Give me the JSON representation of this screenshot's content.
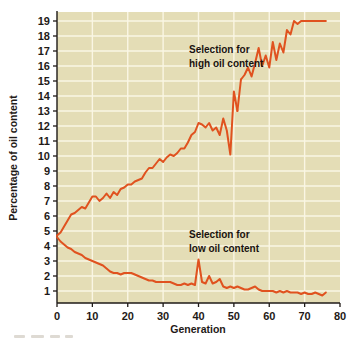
{
  "figure": {
    "background_color": "#ffffff",
    "plot_background_color": "#e4ddb6",
    "grid_color": "#faf6e4",
    "line_color": "#e0521f",
    "axis_color": "#1f1a17"
  },
  "axes": {
    "x": {
      "label": "Generation",
      "ticks": [
        0,
        10,
        20,
        30,
        40,
        50,
        60,
        70,
        80
      ],
      "tick_labels": [
        "0",
        "10",
        "20",
        "30",
        "40",
        "50",
        "60",
        "70",
        "80"
      ],
      "range": [
        0,
        80
      ]
    },
    "y": {
      "label": "Percentage of oil content",
      "ticks": [
        1,
        2,
        3,
        4,
        5,
        6,
        7,
        8,
        9,
        10,
        11,
        12,
        13,
        14,
        15,
        16,
        17,
        18,
        19
      ],
      "tick_labels": [
        "1",
        "2",
        "3",
        "4",
        "5",
        "6",
        "7",
        "8",
        "9",
        "10",
        "11",
        "12",
        "13",
        "14",
        "15",
        "16",
        "17",
        "18",
        "19"
      ],
      "range": [
        0.2,
        19.6
      ]
    }
  },
  "annotations": [
    {
      "id": "high-label",
      "line1": "Selection for",
      "line2": "high oil content",
      "x": 46,
      "y": 17.2
    },
    {
      "id": "low-label",
      "line1": "Selection for",
      "line2": "low oil content",
      "x": 46,
      "y": 4.3
    }
  ],
  "chart_data": {
    "type": "line",
    "title": "",
    "xlabel": "Generation",
    "ylabel": "Percentage of oil content",
    "xlim": [
      0,
      80
    ],
    "ylim": [
      0.2,
      19.6
    ],
    "grid": true,
    "legend": "none",
    "annotations_text": [
      "Selection for high oil content",
      "Selection for low oil content"
    ],
    "series": [
      {
        "name": "Selection for high oil content",
        "color": "#e0521f",
        "x": [
          0,
          1,
          2,
          3,
          4,
          5,
          6,
          7,
          8,
          9,
          10,
          11,
          12,
          13,
          14,
          15,
          16,
          17,
          18,
          19,
          20,
          21,
          22,
          23,
          24,
          25,
          26,
          27,
          28,
          29,
          30,
          31,
          32,
          33,
          34,
          35,
          36,
          37,
          38,
          39,
          40,
          41,
          42,
          43,
          44,
          45,
          46,
          47,
          48,
          49,
          50,
          51,
          52,
          53,
          54,
          55,
          56,
          57,
          58,
          59,
          60,
          61,
          62,
          63,
          64,
          65,
          66,
          67,
          68,
          69,
          70,
          71,
          72,
          73,
          74,
          75,
          76
        ],
        "values": [
          4.7,
          4.9,
          5.3,
          5.7,
          6.1,
          6.2,
          6.4,
          6.6,
          6.5,
          6.9,
          7.3,
          7.3,
          7.0,
          7.2,
          7.5,
          7.2,
          7.6,
          7.4,
          7.8,
          7.9,
          8.1,
          8.1,
          8.3,
          8.4,
          8.5,
          8.9,
          9.2,
          9.2,
          9.5,
          9.8,
          9.6,
          9.9,
          10.1,
          10.0,
          10.2,
          10.5,
          10.5,
          10.9,
          11.4,
          11.6,
          12.2,
          12.1,
          11.9,
          12.2,
          11.7,
          11.9,
          11.4,
          12.5,
          11.7,
          10.1,
          14.3,
          13.0,
          13.6,
          13.2,
          14.4,
          13.0,
          14.3,
          14.1,
          13.9,
          14.5,
          15.6,
          14.3,
          14.0,
          13.8,
          14.2,
          13.5,
          13.1,
          12.1,
          13.3,
          14.4,
          14.2,
          14.9,
          15.2,
          15.0,
          15.2,
          15.4,
          15.4
        ],
        "extra_x": [
          52,
          53,
          54,
          55,
          56,
          57,
          58,
          59,
          60,
          61,
          62,
          63,
          64,
          65,
          66,
          67,
          68,
          69,
          70,
          71,
          72,
          73,
          74,
          75,
          76
        ],
        "extra_values": [
          15.1,
          15.4,
          15.9,
          15.3,
          16.2,
          17.2,
          16.0,
          16.7,
          15.9,
          17.6,
          16.4,
          17.5,
          16.9,
          18.4,
          18.1,
          19.0,
          18.8,
          19.0,
          19.0,
          19.0,
          19.0,
          19.0,
          19.0,
          19.0,
          19.0
        ]
      },
      {
        "name": "Selection for low oil content",
        "color": "#e0521f",
        "x": [
          0,
          1,
          2,
          3,
          4,
          5,
          6,
          7,
          8,
          9,
          10,
          11,
          12,
          13,
          14,
          15,
          16,
          17,
          18,
          19,
          20,
          21,
          22,
          23,
          24,
          25,
          26,
          27,
          28,
          29,
          30,
          31,
          32,
          33,
          34,
          35,
          36,
          37,
          38,
          39,
          40,
          41,
          42,
          43,
          44,
          45,
          46,
          47,
          48,
          49,
          50,
          51,
          52,
          53,
          54,
          55,
          56,
          57,
          58,
          59,
          60,
          61,
          62,
          63,
          64,
          65,
          66,
          67,
          68,
          69,
          70,
          71,
          72,
          73,
          74,
          75,
          76
        ],
        "values": [
          4.6,
          4.3,
          4.1,
          3.9,
          3.8,
          3.6,
          3.5,
          3.4,
          3.2,
          3.1,
          3.0,
          2.9,
          2.8,
          2.7,
          2.5,
          2.3,
          2.2,
          2.2,
          2.1,
          2.2,
          2.2,
          2.2,
          2.1,
          2.0,
          1.9,
          1.8,
          1.7,
          1.7,
          1.6,
          1.6,
          1.6,
          1.6,
          1.6,
          1.5,
          1.4,
          1.4,
          1.5,
          1.4,
          1.5,
          1.4,
          3.1,
          1.6,
          1.5,
          2.0,
          1.5,
          1.6,
          1.8,
          1.3,
          1.2,
          1.3,
          1.2,
          1.3,
          1.2,
          1.1,
          1.1,
          1.2,
          1.3,
          1.1,
          1.0,
          1.0,
          1.0,
          1.0,
          0.9,
          1.0,
          0.9,
          1.0,
          0.9,
          0.9,
          0.9,
          0.8,
          0.9,
          0.8,
          0.8,
          0.9,
          0.8,
          0.7,
          0.9
        ]
      }
    ]
  }
}
